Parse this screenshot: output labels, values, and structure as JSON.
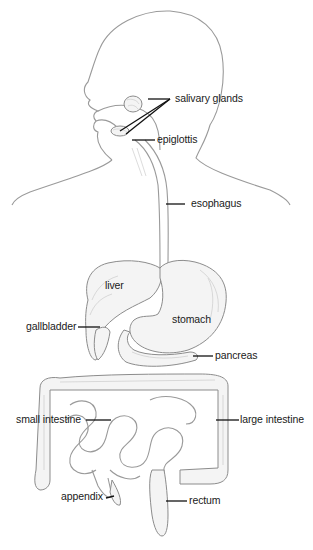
{
  "diagram": {
    "type": "anatomical-illustration",
    "labels": {
      "salivary_glands": "salivary glands",
      "epiglottis": "epiglottis",
      "esophagus": "esophagus",
      "liver": "liver",
      "gallbladder": "gallbladder",
      "stomach": "stomach",
      "pancreas": "pancreas",
      "small_intestine": "small intestine",
      "large_intestine": "large intestine",
      "appendix": "appendix",
      "rectum": "rectum"
    },
    "colors": {
      "outline": "#9a9a9a",
      "label_text": "#1a1a1a",
      "leader_line": "#111111",
      "background": "#ffffff"
    }
  }
}
